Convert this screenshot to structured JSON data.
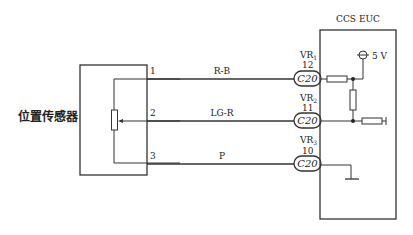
{
  "diagram": {
    "type": "wiring-schematic",
    "sensor": {
      "label": "位置传感器"
    },
    "ecu": {
      "label": "CCS EUC"
    },
    "supply": {
      "label": "5 V"
    },
    "wires": [
      {
        "pin": "1",
        "color_code": "R-B",
        "ecu_terminal": "VR",
        "ecu_terminal_sub": "1",
        "ecu_pin": "12",
        "connector": "C20"
      },
      {
        "pin": "2",
        "color_code": "LG-R",
        "ecu_terminal": "VR",
        "ecu_terminal_sub": "2",
        "ecu_pin": "11",
        "connector": "C20"
      },
      {
        "pin": "3",
        "color_code": "P",
        "ecu_terminal": "VR",
        "ecu_terminal_sub": "3",
        "ecu_pin": "10",
        "connector": "C20"
      }
    ]
  }
}
